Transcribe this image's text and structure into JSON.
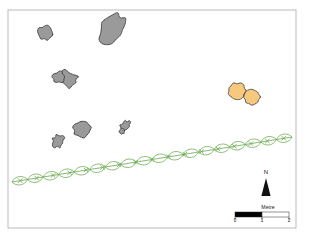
{
  "figure": {
    "type": "site-plan-map",
    "background_color": "#ffffff",
    "frame": {
      "stroke_color": "#b4b4b4",
      "x": 8,
      "y": 10,
      "width": 288,
      "height": 218
    }
  },
  "legend_colors": {
    "stone_fill": "#9a9a9a",
    "stone_outline": "#2b2b2b",
    "pit_fill": "#f7c97e",
    "pit_outline": "#2b2b2b",
    "hedgerow": "#6aa84f",
    "north_arrow": "#111111",
    "scalebar_fill": "#000000",
    "scalebar_empty": "#ffffff"
  },
  "features": {
    "stones": [
      {
        "name": "stone-1",
        "cx": 46,
        "cy": 33,
        "rx": 7.5,
        "ry": 7.0,
        "rotation": 15,
        "wobble": 0.18
      },
      {
        "name": "stone-2",
        "cx": 112,
        "cy": 29,
        "rx": 11.0,
        "ry": 16.0,
        "rotation": 35,
        "wobble": 0.14
      },
      {
        "name": "stone-3",
        "cx": 67,
        "cy": 79,
        "rx": 11.0,
        "ry": 7.0,
        "rotation": 20,
        "wobble": 0.3
      },
      {
        "name": "stone-4",
        "cx": 59,
        "cy": 77,
        "rx": 6.0,
        "ry": 5.5,
        "rotation": 0,
        "wobble": 0.2
      },
      {
        "name": "stone-5",
        "cx": 82,
        "cy": 129,
        "rx": 8.5,
        "ry": 8.0,
        "rotation": 10,
        "wobble": 0.14
      },
      {
        "name": "stone-6",
        "cx": 58,
        "cy": 141,
        "rx": 5.5,
        "ry": 6.5,
        "rotation": 25,
        "wobble": 0.22
      },
      {
        "name": "stone-7",
        "cx": 125,
        "cy": 126,
        "rx": 4.0,
        "ry": 5.5,
        "rotation": 40,
        "wobble": 0.28
      },
      {
        "name": "stone-8",
        "cx": 122,
        "cy": 131,
        "rx": 2.6,
        "ry": 3.0,
        "rotation": 0,
        "wobble": 0.22
      }
    ],
    "pits": [
      {
        "name": "pit-1",
        "cx": 237,
        "cy": 91,
        "rx": 8.5,
        "ry": 8.0,
        "rotation": 0,
        "wobble": 0.1
      },
      {
        "name": "pit-2",
        "cx": 252,
        "cy": 97,
        "rx": 8.0,
        "ry": 7.5,
        "rotation": 0,
        "wobble": 0.1
      }
    ],
    "hedgerow": {
      "name": "hedgerow-line",
      "start_x": 12,
      "start_y": 182,
      "end_x": 292,
      "end_y": 137,
      "marker_count": 17,
      "loop_count": 18,
      "loop_radius": 9.5
    }
  },
  "north_arrow": {
    "label": "N",
    "label_x": 266,
    "label_y": 174,
    "tip_x": 266,
    "tip_y": 178,
    "base_y": 196,
    "half_width": 4.6
  },
  "scale_bar": {
    "label": "Metre",
    "label_x": 268,
    "label_y": 209,
    "x": 235,
    "y": 212,
    "width": 54,
    "height": 5,
    "segments": 2,
    "ticks": [
      "0",
      "1",
      "2"
    ],
    "tick_y": 222
  }
}
